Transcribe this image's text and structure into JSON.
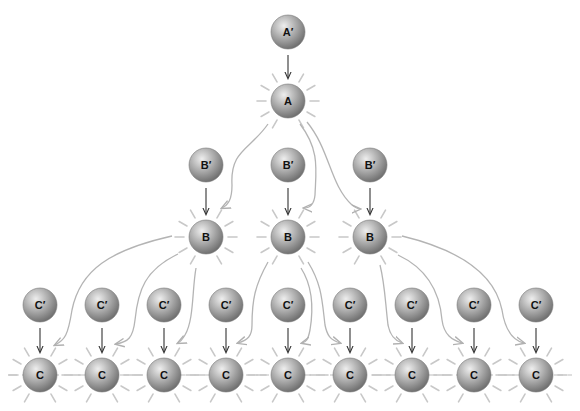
{
  "diagram": {
    "type": "amplification-cascade",
    "colors": {
      "sphere_light": "#e6e6e6",
      "sphere_mid": "#a8a8a8",
      "sphere_dark": "#707070",
      "arrow_dark": "#333333",
      "arrow_light": "#b4b4b4",
      "glow": "#c8c8c8",
      "dash": "#bdbdbd"
    },
    "radius": 17,
    "nodes": {
      "a_prime": {
        "label": "A′",
        "x": 288,
        "y": 32
      },
      "a": {
        "label": "A",
        "x": 288,
        "y": 101,
        "active": true
      },
      "b_prime": [
        {
          "label": "B′",
          "x": 206,
          "y": 165
        },
        {
          "label": "B′",
          "x": 288,
          "y": 165
        },
        {
          "label": "B′",
          "x": 370,
          "y": 165
        }
      ],
      "b": [
        {
          "label": "B",
          "x": 206,
          "y": 237,
          "active": true
        },
        {
          "label": "B",
          "x": 288,
          "y": 237,
          "active": true
        },
        {
          "label": "B",
          "x": 370,
          "y": 237,
          "active": true
        }
      ],
      "c_prime": [
        {
          "label": "C′",
          "x": 40,
          "y": 305
        },
        {
          "label": "C′",
          "x": 102,
          "y": 305
        },
        {
          "label": "C′",
          "x": 164,
          "y": 305
        },
        {
          "label": "C′",
          "x": 226,
          "y": 305
        },
        {
          "label": "C′",
          "x": 288,
          "y": 305
        },
        {
          "label": "C′",
          "x": 350,
          "y": 305
        },
        {
          "label": "C′",
          "x": 412,
          "y": 305
        },
        {
          "label": "C′",
          "x": 474,
          "y": 305
        },
        {
          "label": "C′",
          "x": 536,
          "y": 305
        }
      ],
      "c": [
        {
          "label": "C",
          "x": 40,
          "y": 375,
          "active": true
        },
        {
          "label": "C",
          "x": 102,
          "y": 375,
          "active": true
        },
        {
          "label": "C",
          "x": 164,
          "y": 375,
          "active": true
        },
        {
          "label": "C",
          "x": 226,
          "y": 375,
          "active": true
        },
        {
          "label": "C",
          "x": 288,
          "y": 375,
          "active": true
        },
        {
          "label": "C",
          "x": 350,
          "y": 375,
          "active": true
        },
        {
          "label": "C",
          "x": 412,
          "y": 375,
          "active": true
        },
        {
          "label": "C",
          "x": 474,
          "y": 375,
          "active": true
        },
        {
          "label": "C",
          "x": 536,
          "y": 375,
          "active": true
        }
      ]
    },
    "activation_arrows": [
      {
        "from": "A",
        "d": "M 268 124 C 250 150, 230 150, 232 185 C 232 200, 228 205, 222 208"
      },
      {
        "from": "A",
        "d": "M 300 124 C 320 150, 316 170, 315 195 C 314 205, 310 208, 304 208"
      },
      {
        "from": "A",
        "d": "M 307 122 C 330 150, 330 185, 352 205 C 356 208, 358 209, 360 209"
      },
      {
        "from": "B1",
        "d": "M 172 236 C 110 250, 80 270, 72 310 C 68 335, 65 340, 55 345"
      },
      {
        "from": "B1",
        "d": "M 178 254 C 145 270, 138 290, 135 320 C 133 338, 128 342, 116 344"
      },
      {
        "from": "B1",
        "d": "M 196 268 C 192 290, 194 320, 185 335 C 182 340, 180 342, 178 343"
      },
      {
        "from": "B2",
        "d": "M 268 262 C 255 285, 252 300, 252 325 C 252 336, 248 340, 238 343"
      },
      {
        "from": "B2",
        "d": "M 301 268 C 315 290, 312 318, 310 330 C 308 340, 306 342, 302 343"
      },
      {
        "from": "B2",
        "d": "M 308 262 C 322 285, 322 300, 325 325 C 327 335, 330 340, 340 343"
      },
      {
        "from": "B3",
        "d": "M 380 265 C 385 285, 385 300, 388 325 C 390 335, 394 340, 402 343"
      },
      {
        "from": "B3",
        "d": "M 398 255 C 430 270, 440 295, 442 320 C 444 335, 452 340, 462 343"
      },
      {
        "from": "B3",
        "d": "M 402 236 C 460 250, 495 275, 502 310 C 505 330, 512 340, 524 343"
      }
    ],
    "caption": ""
  }
}
